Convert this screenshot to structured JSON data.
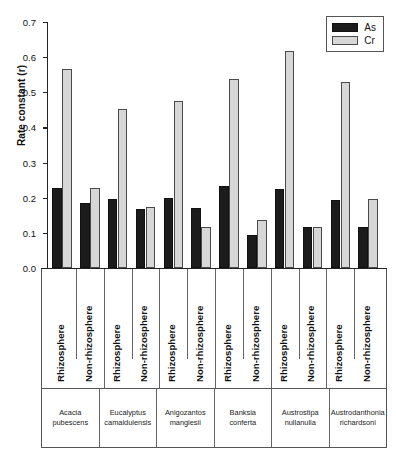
{
  "chart_data": {
    "type": "bar",
    "title": "",
    "xlabel": "",
    "ylabel": "Rate constant (r)",
    "ylim": [
      0.0,
      0.7
    ],
    "ytick_labels": [
      "0.7",
      "0.6",
      "0.5",
      "0.4",
      "0.3",
      "0.2",
      "0.1",
      "0.0"
    ],
    "ytick_values": [
      0.7,
      0.6,
      0.5,
      0.4,
      0.3,
      0.2,
      0.1,
      0.0
    ],
    "grid": false,
    "legend_position": "top-right",
    "legend": [
      {
        "name": "As",
        "color": "#1c1c1c"
      },
      {
        "name": "Cr",
        "color": "#d7d7d7"
      }
    ],
    "categories": [
      "Rhizosphere",
      "Non-rhizosphere",
      "Rhizosphere",
      "Non-rhizosphere",
      "Rhizosphere",
      "Non-rhizosphere",
      "Rhizosphere",
      "Non-rhizosphere",
      "Rhizosphere",
      "Non-rhizosphere",
      "Rhizosphere",
      "Non-rhizosphere"
    ],
    "groups": [
      "Acacia pubescens",
      "Eucalyptus camaldulensis",
      "Anigozantos manglesii",
      "Banksia conferta",
      "Austrostipa nullanulla",
      "Austrodanthonia richardsoni"
    ],
    "series": [
      {
        "name": "As",
        "color": "#1c1c1c",
        "values": [
          0.228,
          0.186,
          0.196,
          0.169,
          0.198,
          0.172,
          0.232,
          0.094,
          0.226,
          0.116,
          0.193,
          0.116
        ]
      },
      {
        "name": "Cr",
        "color": "#d7d7d7",
        "values": [
          0.565,
          0.228,
          0.453,
          0.175,
          0.475,
          0.118,
          0.539,
          0.137,
          0.617,
          0.117,
          0.528,
          0.195
        ]
      }
    ],
    "species_lines": [
      [
        "Acacia",
        "pubescens"
      ],
      [
        "Eucalyptus",
        "camaldulensis"
      ],
      [
        "Anigozantos",
        "manglesii"
      ],
      [
        "Banksia",
        "conferta"
      ],
      [
        "Austrostipa",
        "nullanulla"
      ],
      [
        "Austrodanthonia",
        "richardsoni"
      ]
    ]
  }
}
